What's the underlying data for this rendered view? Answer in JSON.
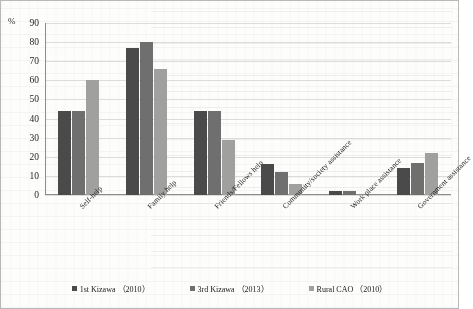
{
  "figure": {
    "unit_label": "%"
  },
  "legend": {
    "items": [
      {
        "label": "1st Kizawa （2010）",
        "color": "#4a4a4a"
      },
      {
        "label": "3rd Kizawa （2013）",
        "color": "#6f6f6f"
      },
      {
        "label": "Rural CAO （2010）",
        "color": "#a0a09e"
      }
    ]
  },
  "chart_data": {
    "type": "bar",
    "title": "",
    "xlabel": "",
    "ylabel": "%",
    "ylim": [
      0,
      90
    ],
    "yticks": [
      0,
      10,
      20,
      30,
      40,
      50,
      60,
      70,
      80,
      90
    ],
    "grid": true,
    "legend_position": "bottom",
    "categories": [
      "Self-help",
      "Family help",
      "Friends/Fellows help",
      "Community/society assistance",
      "Work place assistance",
      "Government assistance"
    ],
    "series": [
      {
        "name": "1st Kizawa （2010）",
        "color": "#4a4a4a",
        "values": [
          44,
          77,
          44,
          16,
          2,
          14
        ]
      },
      {
        "name": "3rd Kizawa （2013）",
        "color": "#6f6f6f",
        "values": [
          44,
          80,
          44,
          12,
          2,
          17
        ]
      },
      {
        "name": "Rural CAO （2010）",
        "color": "#a0a09e",
        "values": [
          60,
          66,
          29,
          6,
          0,
          22
        ]
      }
    ]
  }
}
